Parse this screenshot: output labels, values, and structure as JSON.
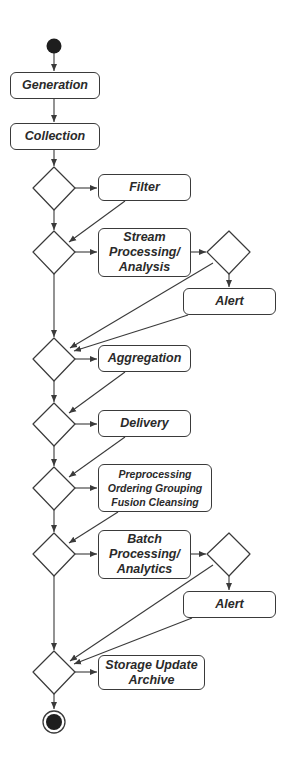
{
  "diagram": {
    "type": "UML activity diagram",
    "colors": {
      "stroke": "#3a3a3a",
      "fill": "#ffffff",
      "node_fill": "#1e1e1e",
      "text": "#2a2a2a"
    },
    "nodes": {
      "start": {
        "kind": "initial-node"
      },
      "generation": {
        "kind": "action",
        "label": "Generation"
      },
      "collection": {
        "kind": "action",
        "label": "Collection"
      },
      "decision1": {
        "kind": "decision"
      },
      "filter": {
        "kind": "action",
        "label": "Filter"
      },
      "decision2": {
        "kind": "decision"
      },
      "stream": {
        "kind": "action",
        "label": "Stream\nProcessing/\nAnalysis"
      },
      "decision_stream_alert": {
        "kind": "decision"
      },
      "alert1": {
        "kind": "action",
        "label": "Alert"
      },
      "decision3": {
        "kind": "decision"
      },
      "aggregation": {
        "kind": "action",
        "label": "Aggregation"
      },
      "decision4": {
        "kind": "decision"
      },
      "delivery": {
        "kind": "action",
        "label": "Delivery"
      },
      "decision5": {
        "kind": "decision"
      },
      "preprocessing": {
        "kind": "action",
        "label": "Preprocessing\nOrdering Grouping\nFusion Cleansing"
      },
      "decision6": {
        "kind": "decision"
      },
      "batch": {
        "kind": "action",
        "label": "Batch\nProcessing/\nAnalytics"
      },
      "decision_batch_alert": {
        "kind": "decision"
      },
      "alert2": {
        "kind": "action",
        "label": "Alert"
      },
      "decision7": {
        "kind": "decision"
      },
      "storage": {
        "kind": "action",
        "label": "Storage Update\nArchive"
      },
      "end": {
        "kind": "final-node"
      }
    },
    "edges": [
      [
        "start",
        "generation"
      ],
      [
        "generation",
        "collection"
      ],
      [
        "collection",
        "decision1"
      ],
      [
        "decision1",
        "filter"
      ],
      [
        "decision1",
        "decision2"
      ],
      [
        "filter",
        "decision2"
      ],
      [
        "decision2",
        "stream"
      ],
      [
        "decision2",
        "decision3"
      ],
      [
        "stream",
        "decision_stream_alert"
      ],
      [
        "decision_stream_alert",
        "alert1"
      ],
      [
        "decision_stream_alert",
        "decision3"
      ],
      [
        "alert1",
        "decision3"
      ],
      [
        "decision3",
        "aggregation"
      ],
      [
        "decision3",
        "decision4"
      ],
      [
        "aggregation",
        "decision4"
      ],
      [
        "decision4",
        "delivery"
      ],
      [
        "decision4",
        "decision5"
      ],
      [
        "delivery",
        "decision5"
      ],
      [
        "decision5",
        "preprocessing"
      ],
      [
        "decision5",
        "decision6"
      ],
      [
        "preprocessing",
        "decision6"
      ],
      [
        "decision6",
        "batch"
      ],
      [
        "decision6",
        "decision7"
      ],
      [
        "batch",
        "decision_batch_alert"
      ],
      [
        "decision_batch_alert",
        "alert2"
      ],
      [
        "decision_batch_alert",
        "decision7"
      ],
      [
        "alert2",
        "decision7"
      ],
      [
        "decision7",
        "storage"
      ],
      [
        "decision7",
        "end"
      ]
    ]
  }
}
